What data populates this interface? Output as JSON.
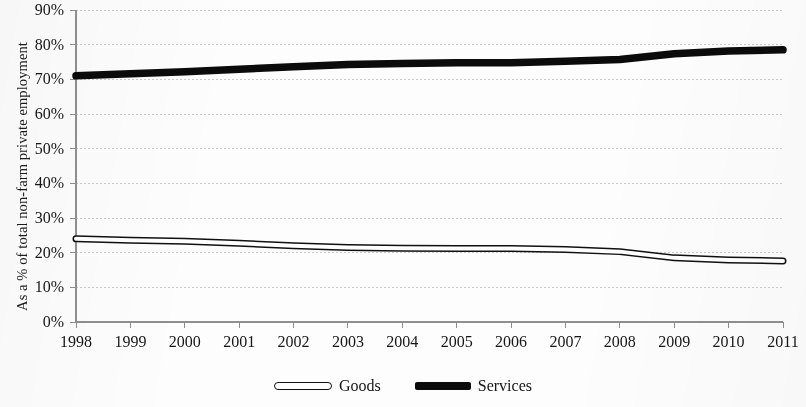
{
  "chart_data": {
    "type": "line",
    "title": "",
    "xlabel": "",
    "ylabel": "As a % of total non-farm private employment",
    "categories": [
      "1998",
      "1999",
      "2000",
      "2001",
      "2002",
      "2003",
      "2004",
      "2005",
      "2006",
      "2007",
      "2008",
      "2009",
      "2010",
      "2011"
    ],
    "x": [
      1998,
      1999,
      2000,
      2001,
      2002,
      2003,
      2004,
      2005,
      2006,
      2007,
      2008,
      2009,
      2010,
      2011
    ],
    "series": [
      {
        "name": "Goods",
        "style": "hollow-outlined-band",
        "values": [
          24.0,
          23.6,
          23.3,
          22.7,
          22.0,
          21.5,
          21.3,
          21.2,
          21.2,
          20.9,
          20.3,
          18.5,
          17.9,
          17.6
        ]
      },
      {
        "name": "Services",
        "style": "thick-solid-black",
        "values": [
          71.0,
          71.6,
          72.2,
          72.9,
          73.6,
          74.3,
          74.6,
          74.8,
          74.8,
          75.2,
          75.7,
          77.4,
          78.2,
          78.5
        ]
      }
    ],
    "ylim": [
      0,
      90
    ],
    "ytick_values": [
      0,
      10,
      20,
      30,
      40,
      50,
      60,
      70,
      80,
      90
    ],
    "ytick_labels": [
      "0%",
      "10%",
      "20%",
      "30%",
      "40%",
      "50%",
      "60%",
      "70%",
      "80%",
      "90%"
    ],
    "grid": "horizontal-dashed",
    "legend_position": "bottom-center",
    "colors": {
      "goods_line": "#101010",
      "goods_fill": "#ffffff",
      "services_line": "#0b0b0b",
      "gridline": "#c9c9c9",
      "axis": "#8f8f8f",
      "text": "#161616"
    }
  },
  "legend": {
    "items": [
      {
        "label": "Goods",
        "marker": "hollow-capsule-icon"
      },
      {
        "label": "Services",
        "marker": "solid-bar-icon"
      }
    ]
  },
  "axes": {
    "y_title": "As a % of total non-farm private employment"
  }
}
